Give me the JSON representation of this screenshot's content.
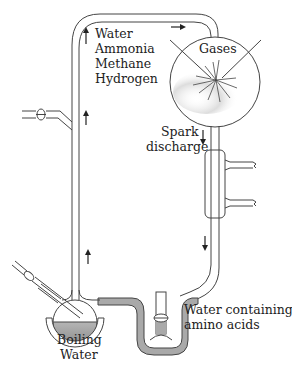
{
  "diagram": {
    "labels": {
      "reagents": [
        "Water",
        "Ammonia",
        "Methane",
        "Hydrogen"
      ],
      "gases": "Gases",
      "spark_line1": "Spark",
      "spark_line2": "discharge",
      "boiling_line1": "Boiling",
      "boiling_line2": "Water",
      "product_line1": "Water containing",
      "product_line2": "amino acids"
    },
    "flow_arrows": [
      {
        "position": "left-tube-top",
        "direction": "up"
      },
      {
        "position": "left-tube-middle",
        "direction": "up"
      },
      {
        "position": "left-tube-lower",
        "direction": "up"
      },
      {
        "position": "top-tube",
        "direction": "right"
      },
      {
        "position": "right-tube-upper",
        "direction": "down"
      },
      {
        "position": "right-tube-lower",
        "direction": "down"
      }
    ],
    "colors": {
      "line": "#444444",
      "liquid": "#a9a9a9",
      "text": "#222222",
      "background": "#ffffff"
    }
  }
}
